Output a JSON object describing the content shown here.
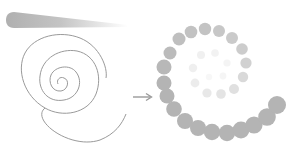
{
  "diagram": {
    "colors": {
      "background": "#ffffff",
      "stroke": "#9a9a9a",
      "dot": "#b4b4b4",
      "arrow": "#9a9a9a",
      "brush_start": "#b0b0b0",
      "brush_end": "#ffffff"
    },
    "brush_stroke": {
      "x1": 8,
      "y1": 20,
      "x2": 128,
      "y2": 26,
      "thickness": 16
    },
    "line_spiral": {
      "cx": 60,
      "cy": 82,
      "stroke_width": 1
    },
    "arrow": {
      "x1": 133,
      "y1": 97,
      "x2": 152,
      "y2": 97,
      "icon": "right-arrow-icon"
    },
    "dot_spiral": {
      "outer_dots": [
        {
          "x": 164,
          "y": 67,
          "r": 7.5,
          "opacity": 0.95
        },
        {
          "x": 170,
          "y": 53,
          "r": 6.5,
          "opacity": 0.9
        },
        {
          "x": 179,
          "y": 39,
          "r": 6.5,
          "opacity": 0.85
        },
        {
          "x": 191,
          "y": 32,
          "r": 6.3,
          "opacity": 0.82
        },
        {
          "x": 205,
          "y": 29,
          "r": 6.2,
          "opacity": 0.8
        },
        {
          "x": 219,
          "y": 31,
          "r": 6,
          "opacity": 0.75
        },
        {
          "x": 232,
          "y": 38,
          "r": 6,
          "opacity": 0.7
        },
        {
          "x": 242,
          "y": 49,
          "r": 5.8,
          "opacity": 0.68
        },
        {
          "x": 246,
          "y": 63,
          "r": 5.6,
          "opacity": 0.62
        },
        {
          "x": 164,
          "y": 83,
          "r": 7.5,
          "opacity": 1
        },
        {
          "x": 167,
          "y": 96,
          "r": 7.5,
          "opacity": 1
        },
        {
          "x": 174,
          "y": 109,
          "r": 7.8,
          "opacity": 1
        },
        {
          "x": 185,
          "y": 121,
          "r": 8,
          "opacity": 1
        },
        {
          "x": 198,
          "y": 128,
          "r": 8,
          "opacity": 1
        },
        {
          "x": 212,
          "y": 132,
          "r": 8.2,
          "opacity": 1
        },
        {
          "x": 227,
          "y": 133,
          "r": 8.2,
          "opacity": 1
        },
        {
          "x": 241,
          "y": 130,
          "r": 8.4,
          "opacity": 1
        },
        {
          "x": 254,
          "y": 125,
          "r": 8.6,
          "opacity": 1
        },
        {
          "x": 267,
          "y": 117,
          "r": 8.8,
          "opacity": 1
        },
        {
          "x": 277,
          "y": 105,
          "r": 9,
          "opacity": 1
        }
      ],
      "inner_dots": [
        {
          "x": 243,
          "y": 77,
          "r": 5.2,
          "opacity": 0.5
        },
        {
          "x": 234,
          "y": 89,
          "r": 5,
          "opacity": 0.42
        },
        {
          "x": 221,
          "y": 94,
          "r": 4.8,
          "opacity": 0.36
        },
        {
          "x": 207,
          "y": 93,
          "r": 4.6,
          "opacity": 0.3
        },
        {
          "x": 195,
          "y": 83,
          "r": 4.4,
          "opacity": 0.26
        },
        {
          "x": 193,
          "y": 68,
          "r": 4.2,
          "opacity": 0.22
        },
        {
          "x": 201,
          "y": 55,
          "r": 4,
          "opacity": 0.2
        },
        {
          "x": 215,
          "y": 53,
          "r": 3.8,
          "opacity": 0.17
        },
        {
          "x": 227,
          "y": 63,
          "r": 3.6,
          "opacity": 0.15
        },
        {
          "x": 223,
          "y": 76,
          "r": 3.4,
          "opacity": 0.13
        },
        {
          "x": 209,
          "y": 77,
          "r": 3.2,
          "opacity": 0.11
        }
      ]
    }
  }
}
